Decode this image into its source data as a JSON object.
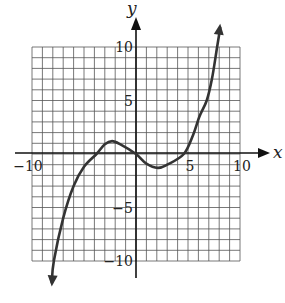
{
  "chart_data": {
    "type": "line",
    "title": "",
    "xlabel": "x",
    "ylabel": "y",
    "xlim": [
      -10,
      10
    ],
    "ylim": [
      -10,
      10
    ],
    "grid": true,
    "grid_step": 1,
    "x_ticks": [
      {
        "value": -10,
        "label": "−10"
      },
      {
        "value": 5,
        "label": "5"
      },
      {
        "value": 10,
        "label": "10"
      }
    ],
    "y_ticks": [
      {
        "value": 10,
        "label": "10"
      },
      {
        "value": 5,
        "label": "5"
      },
      {
        "value": -5,
        "label": "−5"
      },
      {
        "value": -10,
        "label": "−10"
      }
    ],
    "series": [
      {
        "name": "cubic curve",
        "x": [
          -8.1,
          -7.9,
          -7.0,
          -6.0,
          -5.0,
          -3.8,
          -3.0,
          -2.3,
          -1.5,
          0.0,
          1.0,
          2.1,
          3.0,
          4.6,
          5.5,
          6.1,
          6.8,
          7.3,
          7.8,
          8.1
        ],
        "y": [
          -12.0,
          -10.0,
          -6.0,
          -3.0,
          -1.2,
          0.0,
          0.9,
          1.2,
          0.9,
          0.0,
          -0.9,
          -1.3,
          -1.0,
          0.0,
          1.8,
          3.5,
          5.0,
          7.0,
          10.0,
          11.8
        ],
        "arrows_at_ends": true,
        "color": "#333333"
      }
    ],
    "features": {
      "local_max": [
        -2.3,
        1.2
      ],
      "local_min": [
        2.1,
        -1.3
      ],
      "x_intercepts": [
        -3.8,
        0,
        4.6
      ]
    }
  },
  "labels": {
    "x_axis": "x",
    "y_axis": "y"
  }
}
